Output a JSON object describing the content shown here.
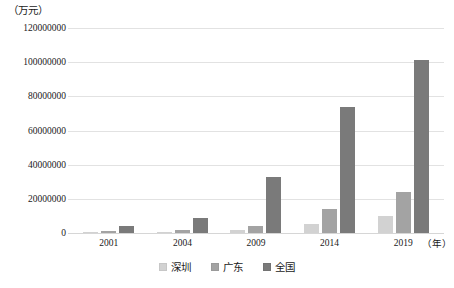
{
  "chart_data": {
    "type": "bar",
    "title": "",
    "subtitle": "",
    "unit_label": "（万元）",
    "xlabel": "（年）",
    "ylabel": "",
    "categories": [
      "2001",
      "2004",
      "2009",
      "2014",
      "2019"
    ],
    "series": [
      {
        "name": "深圳",
        "color": "#d2d2d2",
        "values": [
          300000,
          600000,
          1500000,
          5000000,
          10000000
        ]
      },
      {
        "name": "广东",
        "color": "#a3a3a3",
        "values": [
          1300000,
          2000000,
          4000000,
          14000000,
          24000000
        ]
      },
      {
        "name": "全国",
        "color": "#7a7a7a",
        "values": [
          4000000,
          9000000,
          33000000,
          74000000,
          101000000
        ]
      }
    ],
    "ylim": [
      0,
      120000000
    ],
    "ytick_step": 20000000,
    "yticks": [
      "0",
      "20000000",
      "40000000",
      "60000000",
      "80000000",
      "100000000",
      "120000000"
    ],
    "grid": true,
    "grid_color": "#e2e2e2",
    "legend_position": "bottom",
    "legend": [
      "深圳",
      "广东",
      "全国"
    ],
    "background": "#ffffff"
  }
}
